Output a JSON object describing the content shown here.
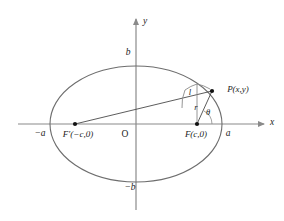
{
  "figure": {
    "colors": {
      "axis": "#8a8a8a",
      "curve": "#6e6e6e",
      "chord": "#4a4a4a",
      "helper": "#8a8a8a",
      "point": "#111111",
      "label": "#1b1b1b",
      "background": "#ffffff"
    },
    "axes": {
      "x_label": "x",
      "y_label": "y",
      "origin_label": "O"
    },
    "labels": {
      "semi_major_positive": "a",
      "semi_major_negative": "−a",
      "semi_minor_positive": "b",
      "semi_minor_negative": "−b",
      "focus_right": "F(c,0)",
      "focus_left": "F′(−c,0)",
      "point_p": "P(x,y)",
      "focal_radius": "r",
      "semi_latus_rectum": "l",
      "polar_angle": "θ"
    },
    "geometry": {
      "center": {
        "x": 136,
        "y": 124
      },
      "semi_major_px": 86,
      "semi_minor_px": 58,
      "focus_right": {
        "x": 197,
        "y": 124
      },
      "focus_left": {
        "x": 75,
        "y": 124
      },
      "point_p": {
        "x": 212,
        "y": 91
      },
      "x_axis_start": {
        "x": 18,
        "y": 124
      },
      "x_axis_end": {
        "x": 266,
        "y": 124
      },
      "y_axis_top": {
        "x": 136,
        "y": 17
      },
      "y_axis_bottom": {
        "x": 136,
        "y": 210
      }
    }
  }
}
